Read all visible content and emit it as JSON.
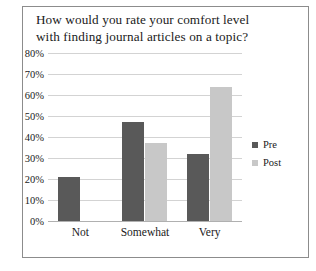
{
  "chart_data": {
    "type": "bar",
    "title": "How would you rate your comfort level with finding journal articles on a topic?",
    "title_lines": [
      "How would you rate your comfort level",
      "with finding journal articles on a topic?"
    ],
    "xlabel": "",
    "ylabel": "",
    "ylim": [
      0,
      80
    ],
    "ytick_step": 10,
    "grid": true,
    "legend_position": "right",
    "categories": [
      "Not",
      "Somewhat",
      "Very"
    ],
    "ytick_labels": [
      "0%",
      "10%",
      "20%",
      "30%",
      "40%",
      "50%",
      "60%",
      "70%",
      "80%"
    ],
    "series": [
      {
        "name": "Pre",
        "color": "#595959",
        "values": [
          21,
          47,
          32
        ]
      },
      {
        "name": "Post",
        "color": "#c8c8c8",
        "values": [
          0,
          37,
          64
        ]
      }
    ]
  },
  "colors": {
    "pre": "#595959",
    "post": "#c8c8c8",
    "gridline": "#d3d3d3",
    "border": "#8c8c8c",
    "text": "#1a1a1a",
    "background": "#ffffff"
  },
  "legend": {
    "items": [
      {
        "label": "Pre"
      },
      {
        "label": "Post"
      }
    ]
  }
}
